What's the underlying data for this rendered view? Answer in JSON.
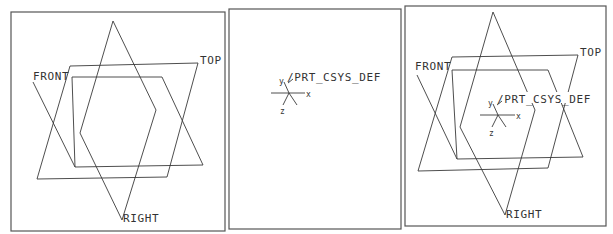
{
  "panels": [
    {
      "id": "datum-planes",
      "labels": {
        "front": "FRONT",
        "top": "TOP",
        "right": "RIGHT"
      }
    },
    {
      "id": "coordinate-system",
      "labels": {
        "csys": "/PRT_CSYS_DEF",
        "x": "x",
        "y": "y",
        "z": "z"
      }
    },
    {
      "id": "combined",
      "labels": {
        "front": "FRONT",
        "top": "TOP",
        "right": "RIGHT",
        "csys": "/PRT_CSYS_DEF",
        "x": "x",
        "y": "y",
        "z": "z"
      }
    }
  ],
  "colors": {
    "line": "#3a3a3a",
    "frame": "#555555",
    "background": "#ffffff"
  }
}
